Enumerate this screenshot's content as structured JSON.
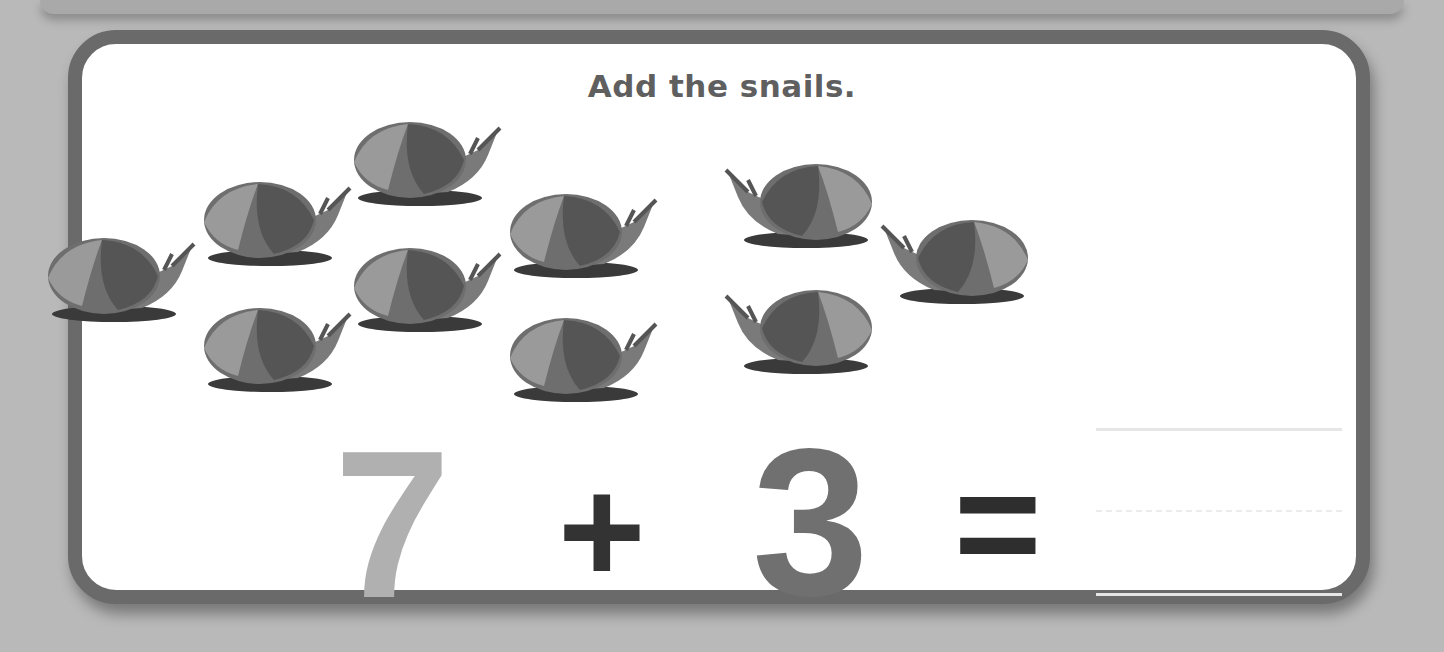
{
  "worksheet": {
    "instruction": "Add the snails.",
    "group_a_count": 7,
    "group_b_count": 3,
    "equation": {
      "addend_1": "7",
      "operator": "+",
      "addend_2": "3",
      "equals": "=",
      "answer": ""
    },
    "colors": {
      "background": "#b9b9b9",
      "card_border": "#6a6a6a",
      "card_fill": "#ffffff",
      "title": "#5f5f5f",
      "addend_1": "#b0b0b0",
      "addend_2": "#707070",
      "operators": "#333333"
    }
  }
}
